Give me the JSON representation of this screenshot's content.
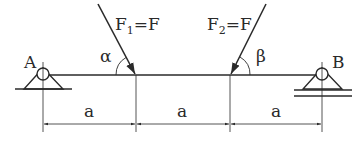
{
  "diagram": {
    "type": "beam-loading",
    "colors": {
      "line": "#2a2a2a",
      "background": "#ffffff"
    },
    "supports": {
      "left": {
        "label": "A",
        "kind": "pinned"
      },
      "right": {
        "label": "B",
        "kind": "roller"
      }
    },
    "forces": [
      {
        "label_main": "F",
        "label_sub": "1",
        "label_rest": "=F",
        "angle_label": "α"
      },
      {
        "label_main": "F",
        "label_sub": "2",
        "label_rest": "=F",
        "angle_label": "β"
      }
    ],
    "dimensions": [
      {
        "label": "a"
      },
      {
        "label": "a"
      },
      {
        "label": "a"
      }
    ]
  }
}
